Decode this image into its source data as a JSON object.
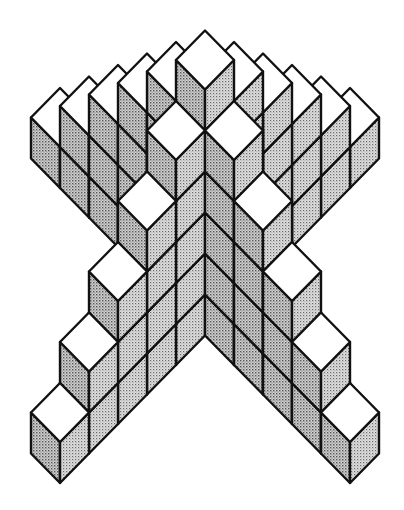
{
  "diagram": {
    "title": "",
    "projection": {
      "type": "isometric-45",
      "origin_x": 205,
      "origin_y": 276.5,
      "unit_x": 29,
      "unit_y": 29.5,
      "unit_z": 41
    },
    "style": {
      "background": "#ffffff",
      "outline_color": "#111111",
      "outline_width": 2.4,
      "top_face_color": "#ffffff",
      "left_face_base": "#d2d2d2",
      "left_face_dot": "#555555",
      "right_face_base": "#dedede",
      "right_face_dot": "#6a6a6a"
    },
    "columns": [
      {
        "name": "center-tower",
        "gx": 0,
        "gy": 0,
        "height": 6
      },
      {
        "name": "upper-left-arm-1",
        "gx": -1,
        "gy": 0,
        "height": 5
      },
      {
        "name": "upper-left-arm-2",
        "gx": -2,
        "gy": 0,
        "height": 4
      },
      {
        "name": "upper-left-arm-3",
        "gx": -3,
        "gy": 0,
        "height": 3
      },
      {
        "name": "upper-left-arm-4",
        "gx": -4,
        "gy": 0,
        "height": 2
      },
      {
        "name": "upper-left-arm-5",
        "gx": -5,
        "gy": 0,
        "height": 1
      },
      {
        "name": "upper-right-arm-1",
        "gx": 0,
        "gy": -1,
        "height": 5
      },
      {
        "name": "upper-right-arm-2",
        "gx": 0,
        "gy": -2,
        "height": 4
      },
      {
        "name": "upper-right-arm-3",
        "gx": 0,
        "gy": -3,
        "height": 3
      },
      {
        "name": "upper-right-arm-4",
        "gx": 0,
        "gy": -4,
        "height": 2
      },
      {
        "name": "upper-right-arm-5",
        "gx": 0,
        "gy": -5,
        "height": 1
      },
      {
        "name": "lower-left-arm-1",
        "gx": 0,
        "gy": 1,
        "height": 5
      },
      {
        "name": "lower-left-arm-2",
        "gx": 0,
        "gy": 2,
        "height": 4
      },
      {
        "name": "lower-left-arm-3",
        "gx": 0,
        "gy": 3,
        "height": 3
      },
      {
        "name": "lower-left-arm-4",
        "gx": 0,
        "gy": 4,
        "height": 2
      },
      {
        "name": "lower-left-arm-5",
        "gx": 0,
        "gy": 5,
        "height": 1
      },
      {
        "name": "lower-right-arm-1",
        "gx": 1,
        "gy": 0,
        "height": 5
      },
      {
        "name": "lower-right-arm-2",
        "gx": 2,
        "gy": 0,
        "height": 4
      },
      {
        "name": "lower-right-arm-3",
        "gx": 3,
        "gy": 0,
        "height": 3
      },
      {
        "name": "lower-right-arm-4",
        "gx": 4,
        "gy": 0,
        "height": 2
      },
      {
        "name": "lower-right-arm-5",
        "gx": 5,
        "gy": 0,
        "height": 1
      }
    ],
    "total_cubes": 66
  }
}
